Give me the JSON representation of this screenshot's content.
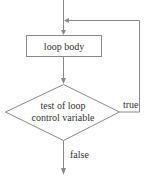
{
  "diagram": {
    "type": "flowchart",
    "title": "",
    "nodes": [
      {
        "id": "loop-body",
        "shape": "rectangle",
        "label": "loop body"
      },
      {
        "id": "test",
        "shape": "diamond",
        "label_lines": [
          "test of loop",
          "control variable"
        ]
      }
    ],
    "edges": [
      {
        "from": "entry",
        "to": "loop-body",
        "label": ""
      },
      {
        "from": "loop-body",
        "to": "test",
        "label": ""
      },
      {
        "from": "test",
        "to": "loop-body",
        "label": "true"
      },
      {
        "from": "test",
        "to": "exit",
        "label": "false"
      }
    ],
    "colors": {
      "stroke": "#8a8a8a",
      "text": "#333333",
      "background": "#ffffff"
    }
  }
}
